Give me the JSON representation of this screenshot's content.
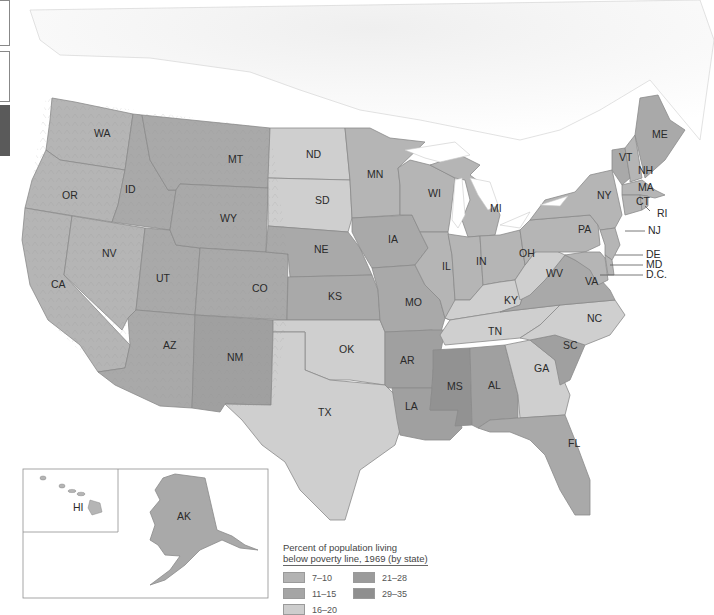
{
  "legend": {
    "title_line1": "Percent of population living",
    "title_line2": "below poverty line, 1969 (by state)",
    "items": [
      {
        "range": "7–10",
        "color": "#b3b3b3"
      },
      {
        "range": "21–28",
        "color": "#9b9b9b"
      },
      {
        "range": "11–15",
        "color": "#a5a5a5"
      },
      {
        "range": "29–35",
        "color": "#8f8f8f"
      },
      {
        "range": "16–20",
        "color": "#cdcdcd"
      }
    ]
  },
  "colors": {
    "c7_10": "#b5b5b5",
    "c11_15": "#a9a9a9",
    "c16_20": "#cfcfcf",
    "c21_28": "#a0a0a0",
    "c29_35": "#929292",
    "land_bg": "#ececec",
    "water": "#ffffff"
  },
  "states": [
    {
      "abbr": "WA",
      "category": "7-10"
    },
    {
      "abbr": "OR",
      "category": "7-10"
    },
    {
      "abbr": "CA",
      "category": "7-10"
    },
    {
      "abbr": "ID",
      "category": "11-15"
    },
    {
      "abbr": "NV",
      "category": "7-10"
    },
    {
      "abbr": "UT",
      "category": "11-15"
    },
    {
      "abbr": "AZ",
      "category": "11-15"
    },
    {
      "abbr": "MT",
      "category": "11-15"
    },
    {
      "abbr": "WY",
      "category": "11-15"
    },
    {
      "abbr": "CO",
      "category": "11-15"
    },
    {
      "abbr": "NM",
      "category": "21-28"
    },
    {
      "abbr": "ND",
      "category": "16-20"
    },
    {
      "abbr": "SD",
      "category": "16-20"
    },
    {
      "abbr": "NE",
      "category": "11-15"
    },
    {
      "abbr": "KS",
      "category": "11-15"
    },
    {
      "abbr": "OK",
      "category": "16-20"
    },
    {
      "abbr": "TX",
      "category": "16-20"
    },
    {
      "abbr": "MN",
      "category": "7-10"
    },
    {
      "abbr": "IA",
      "category": "11-15"
    },
    {
      "abbr": "MO",
      "category": "11-15"
    },
    {
      "abbr": "AR",
      "category": "21-28"
    },
    {
      "abbr": "LA",
      "category": "21-28"
    },
    {
      "abbr": "WI",
      "category": "7-10"
    },
    {
      "abbr": "IL",
      "category": "7-10"
    },
    {
      "abbr": "MI",
      "category": "7-10"
    },
    {
      "abbr": "IN",
      "category": "7-10"
    },
    {
      "abbr": "OH",
      "category": "7-10"
    },
    {
      "abbr": "KY",
      "category": "16-20"
    },
    {
      "abbr": "TN",
      "category": "16-20"
    },
    {
      "abbr": "MS",
      "category": "29-35"
    },
    {
      "abbr": "AL",
      "category": "21-28"
    },
    {
      "abbr": "GA",
      "category": "16-20"
    },
    {
      "abbr": "FL",
      "category": "11-15"
    },
    {
      "abbr": "SC",
      "category": "21-28"
    },
    {
      "abbr": "NC",
      "category": "16-20"
    },
    {
      "abbr": "VA",
      "category": "11-15"
    },
    {
      "abbr": "WV",
      "category": "16-20"
    },
    {
      "abbr": "PA",
      "category": "7-10"
    },
    {
      "abbr": "NY",
      "category": "7-10"
    },
    {
      "abbr": "VT",
      "category": "11-15"
    },
    {
      "abbr": "NH",
      "category": "7-10"
    },
    {
      "abbr": "ME",
      "category": "11-15"
    },
    {
      "abbr": "MA",
      "category": "7-10"
    },
    {
      "abbr": "CT",
      "category": "7-10"
    },
    {
      "abbr": "RI",
      "category": "7-10"
    },
    {
      "abbr": "NJ",
      "category": "7-10"
    },
    {
      "abbr": "DE",
      "category": "7-10"
    },
    {
      "abbr": "MD",
      "category": "7-10"
    },
    {
      "abbr": "D.C.",
      "category": "11-15"
    },
    {
      "abbr": "HI",
      "category": "7-10"
    },
    {
      "abbr": "AK",
      "category": "11-15"
    }
  ],
  "labels": {
    "WA": "WA",
    "OR": "OR",
    "CA": "CA",
    "ID": "ID",
    "NV": "NV",
    "UT": "UT",
    "AZ": "AZ",
    "MT": "MT",
    "WY": "WY",
    "CO": "CO",
    "NM": "NM",
    "ND": "ND",
    "SD": "SD",
    "NE": "NE",
    "KS": "KS",
    "OK": "OK",
    "TX": "TX",
    "MN": "MN",
    "IA": "IA",
    "MO": "MO",
    "AR": "AR",
    "LA": "LA",
    "WI": "WI",
    "IL": "IL",
    "MI": "MI",
    "IN": "IN",
    "OH": "OH",
    "KY": "KY",
    "TN": "TN",
    "MS": "MS",
    "AL": "AL",
    "GA": "GA",
    "FL": "FL",
    "SC": "SC",
    "NC": "NC",
    "VA": "VA",
    "WV": "WV",
    "PA": "PA",
    "NY": "NY",
    "VT": "VT",
    "NH": "NH",
    "ME": "ME",
    "MA": "MA",
    "CT": "CT",
    "RI": "RI",
    "NJ": "NJ",
    "DE": "DE",
    "MD": "MD",
    "DC": "D.C.",
    "HI": "HI",
    "AK": "AK"
  }
}
